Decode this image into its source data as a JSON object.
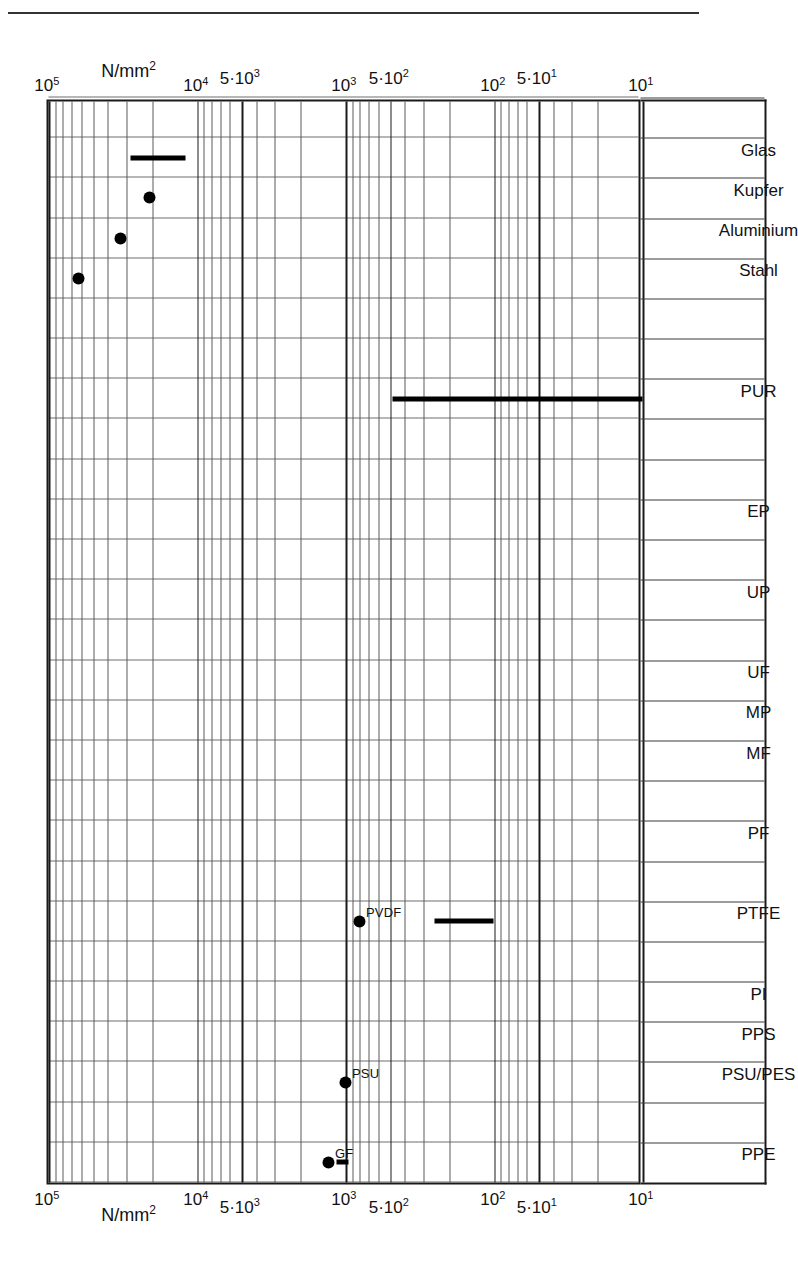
{
  "figure": {
    "unit_label": "N/mm2",
    "unit_label_base": "N/mm",
    "unit_label_sup": "2",
    "has_header_rule": true
  },
  "axis": {
    "scale": "log",
    "min": 10,
    "max": 100000,
    "ticks": [
      {
        "value": 10,
        "label_base": "10",
        "label_sup": "1",
        "major": true
      },
      {
        "value": 50,
        "label_base": "5·10",
        "label_sup": "1",
        "major": true
      },
      {
        "value": 100,
        "label_base": "10",
        "label_sup": "2",
        "major": true
      },
      {
        "value": 500,
        "label_base": "5·10",
        "label_sup": "2",
        "major": true
      },
      {
        "value": 1000,
        "label_base": "10",
        "label_sup": "3",
        "major": true
      },
      {
        "value": 5000,
        "label_base": "5·10",
        "label_sup": "3",
        "major": true
      },
      {
        "value": 10000,
        "label_base": "10",
        "label_sup": "4",
        "major": true
      },
      {
        "value": 100000,
        "label_base": "10",
        "label_sup": "5",
        "major": true
      }
    ]
  },
  "chart_data": {
    "type": "bar",
    "orientation": "horizontal-ranges-rotated",
    "title": "",
    "xlabel": "N/mm2",
    "ylabel": "",
    "xscale": "log",
    "xlim": [
      10,
      100000
    ],
    "grid": true,
    "legend": "none",
    "categories": [
      "PPE",
      "",
      "PSU/PES",
      "PPS",
      "PI",
      "",
      "PTFE",
      "",
      "PF",
      "",
      "MF",
      "MP",
      "UF",
      "",
      "UP",
      "",
      "EP",
      "",
      "",
      "PUR",
      "",
      "",
      "Stahl",
      "Aluminium",
      "Kupfer",
      "Glas",
      ""
    ],
    "series": [
      {
        "name": "Elastizitaetsmodul Bereich",
        "kind": "range-bars",
        "items": [
          {
            "category": "PPE",
            "low": 950,
            "high": 1150,
            "label": ""
          },
          {
            "category": "PTFE",
            "low": 100,
            "high": 250,
            "label": ""
          },
          {
            "category": "PUR",
            "low": 10,
            "high": 480,
            "label": ""
          },
          {
            "category": "Glas",
            "low": 12000,
            "high": 28000,
            "label": ""
          }
        ]
      },
      {
        "name": "Einzelwerte",
        "kind": "points",
        "items": [
          {
            "category": "PPE",
            "value": 1300,
            "label": "GF"
          },
          {
            "category": "PSU/PES",
            "value": 1000,
            "label": "PSU"
          },
          {
            "category": "PTFE",
            "value": 800,
            "label": "PVDF"
          },
          {
            "category": "Stahl",
            "value": 63000,
            "label": ""
          },
          {
            "category": "Aluminium",
            "value": 33000,
            "label": ""
          },
          {
            "category": "Kupfer",
            "value": 21000,
            "label": ""
          }
        ]
      }
    ]
  }
}
